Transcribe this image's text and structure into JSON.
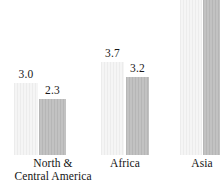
{
  "chart_data": {
    "type": "bar",
    "title": "",
    "subtitle": "",
    "xlabel": "",
    "ylabel": "",
    "grid": false,
    "legend": "none",
    "axis_line": false,
    "ylim": [
      0,
      6.4
    ],
    "note": "Asia bars extend beyond the top edge of the image and have no visible value labels",
    "categories": [
      "North & Central America",
      "Africa",
      "Asia"
    ],
    "series": [
      {
        "name": "light",
        "color": "#f1f1f1",
        "values": [
          3.0,
          3.7,
          null
        ],
        "labels": [
          "3.0",
          "3.7",
          ""
        ]
      },
      {
        "name": "dark",
        "color": "#bdbdbd",
        "values": [
          2.3,
          3.2,
          null
        ],
        "labels": [
          "2.3",
          "3.2",
          ""
        ]
      }
    ]
  },
  "groups": [
    {
      "name": "north-central-america",
      "label_line1": "North &",
      "label_line2": "Central America",
      "label_left": 6,
      "label_width": 94,
      "left": 14,
      "bars": [
        {
          "name": "light",
          "style": "light",
          "left": 0,
          "width": 24,
          "height": 72,
          "label": "3.0",
          "label_bottom": 75
        },
        {
          "name": "dark",
          "style": "dark",
          "left": 25,
          "width": 27,
          "height": 56,
          "label": "2.3",
          "label_bottom": 59
        }
      ]
    },
    {
      "name": "africa",
      "label_line1": "Africa",
      "label_line2": "",
      "label_left": 90,
      "label_width": 70,
      "left": 101,
      "bars": [
        {
          "name": "light",
          "style": "light",
          "left": 0,
          "width": 23,
          "height": 93,
          "label": "3.7",
          "label_bottom": 96
        },
        {
          "name": "dark",
          "style": "dark",
          "left": 25,
          "width": 23,
          "height": 78,
          "label": "3.2",
          "label_bottom": 81
        }
      ]
    },
    {
      "name": "asia",
      "label_line1": "Asia",
      "label_line2": "",
      "label_left": 170,
      "label_width": 64,
      "left": 180,
      "bars": [
        {
          "name": "light",
          "style": "light",
          "left": 0,
          "width": 22,
          "height": 160,
          "label": "",
          "label_bottom": 0
        },
        {
          "name": "dark",
          "style": "dark",
          "left": 23,
          "width": 24,
          "height": 168,
          "label": "",
          "label_bottom": 0
        }
      ]
    }
  ]
}
